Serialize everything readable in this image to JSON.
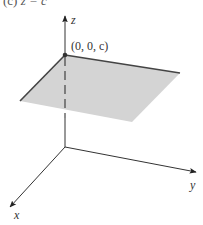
{
  "figure": {
    "caption_prefix": "(c)",
    "caption_equation": "z = c",
    "axes": {
      "x_label": "x",
      "y_label": "y",
      "z_label": "z"
    },
    "point": {
      "label": "(0, 0, c)"
    },
    "colors": {
      "plane_fill": "#d4d4d4",
      "plane_edge": "#444444",
      "axis": "#333333",
      "point": "#333333"
    }
  }
}
